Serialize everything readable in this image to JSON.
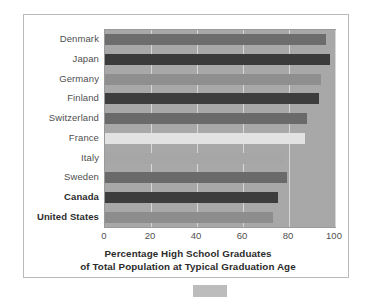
{
  "chart_data": {
    "type": "bar",
    "orientation": "horizontal",
    "title": "",
    "xlabel": "Percentage High School Graduates of Total Population at Typical Graduation Age",
    "ylabel": "",
    "xlim": [
      0,
      100
    ],
    "ylim": null,
    "grid": true,
    "legend": null,
    "categories": [
      "Denmark",
      "Japan",
      "Germany",
      "Finland",
      "Switzerland",
      "France",
      "Italy",
      "Sweden",
      "Canada",
      "United States"
    ],
    "values": [
      96,
      98,
      94,
      93,
      88,
      87,
      78,
      79,
      75,
      73
    ],
    "bar_colors": [
      "#6d6d6d",
      "#3b3b3b",
      "#8f8f8f",
      "#3d3d3d",
      "#6a6a6a",
      "#e2e2e2",
      "#a6a6a6",
      "#6a6a6a",
      "#3d3d3d",
      "#8d8d8d"
    ],
    "emphasized_categories": [
      "Canada",
      "United States"
    ],
    "xticks": [
      0,
      20,
      40,
      60,
      80,
      100
    ],
    "xtick_labels": [
      "0",
      "20",
      "40",
      "60",
      "80",
      "100"
    ],
    "plot_background": "#a8a8a8",
    "gridline_color": "#d7d7d7",
    "frame_color": "#b9b9b9"
  },
  "axis_title": {
    "line1": "Percentage High School Graduates",
    "line2": "of Total Population at Typical Graduation Age"
  }
}
